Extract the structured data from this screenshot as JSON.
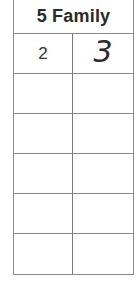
{
  "table": {
    "title": "5 Family",
    "rows": [
      {
        "given": "2",
        "answer": "3"
      },
      {
        "given": "",
        "answer": ""
      },
      {
        "given": "",
        "answer": ""
      },
      {
        "given": "",
        "answer": ""
      },
      {
        "given": "",
        "answer": ""
      },
      {
        "given": "",
        "answer": ""
      }
    ]
  },
  "colors": {
    "border": "#8a8a8a",
    "text": "#2a2a2a",
    "background": "#ffffff"
  }
}
